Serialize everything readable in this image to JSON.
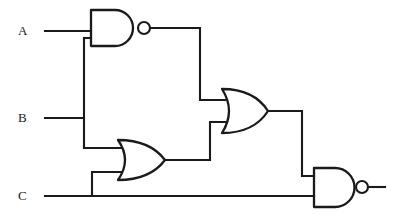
{
  "diagram": {
    "type": "logic-circuit-schematic",
    "width": 401,
    "height": 219,
    "background_color": "#ffffff",
    "line_color": "#1a1a1a"
  },
  "inputs": [
    {
      "id": "A",
      "label": "A",
      "label_x": 18,
      "label_y": 24,
      "wire_y": 31
    },
    {
      "id": "B",
      "label": "B",
      "label_x": 18,
      "label_y": 111,
      "wire_y": 118
    },
    {
      "id": "C",
      "label": "C",
      "label_x": 18,
      "label_y": 189,
      "wire_y": 196
    }
  ],
  "gates": [
    {
      "id": "gate1",
      "name": "nand-gate-1",
      "type": "NAND",
      "label": "NAND",
      "inputs": [
        "A",
        "B"
      ],
      "output": "n1",
      "x": 90,
      "y": 10,
      "w": 48,
      "h": 36,
      "has_bubble": true
    },
    {
      "id": "gate2",
      "name": "or-gate-1",
      "type": "OR",
      "label": "OR",
      "inputs": [
        "B",
        "C"
      ],
      "output": "n2",
      "x": 117,
      "y": 140,
      "w": 48,
      "h": 40,
      "has_bubble": false
    },
    {
      "id": "gate3",
      "name": "or-gate-2",
      "type": "OR",
      "label": "OR",
      "inputs": [
        "n1",
        "n2"
      ],
      "output": "n3",
      "x": 221,
      "y": 89,
      "w": 47,
      "h": 44,
      "has_bubble": false
    },
    {
      "id": "gate4",
      "name": "nand-gate-2",
      "type": "NAND",
      "label": "NAND",
      "inputs": [
        "n3",
        "C"
      ],
      "output": "out",
      "x": 313,
      "y": 168,
      "w": 43,
      "h": 39,
      "has_bubble": true
    }
  ],
  "nets": [
    {
      "id": "a-input-wire",
      "from": "A",
      "to": "gate1.in1"
    },
    {
      "id": "b-input-wire",
      "from": "B",
      "to": "branch-b"
    },
    {
      "id": "b-to-nand1-wire",
      "from": "B",
      "to": "gate1.in2"
    },
    {
      "id": "b-to-or1-wire",
      "from": "B",
      "to": "gate2.in1"
    },
    {
      "id": "c-input-wire",
      "from": "C",
      "to": "gate4.in2"
    },
    {
      "id": "c-to-or1-wire",
      "from": "C",
      "to": "gate2.in2"
    },
    {
      "id": "nand1-out-wire",
      "from": "gate1",
      "to": "gate3.in1"
    },
    {
      "id": "or1-out-wire",
      "from": "gate2",
      "to": "gate3.in2"
    },
    {
      "id": "or2-out-wire",
      "from": "gate3",
      "to": "gate4.in1"
    },
    {
      "id": "circuit-output-wire",
      "from": "gate4",
      "to": "output"
    }
  ]
}
